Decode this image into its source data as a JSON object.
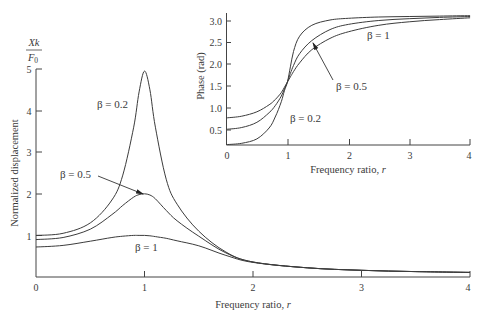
{
  "chart_data": [
    {
      "id": "amplitude",
      "type": "line",
      "title": "",
      "xlabel": "Frequency ratio, r",
      "ylabel": "Normalized displacement",
      "ylabel_top": {
        "numerator": "Xk",
        "denominator": "F0"
      },
      "xlim": [
        0,
        4
      ],
      "ylim": [
        0,
        5
      ],
      "xticks": [
        "0",
        "1",
        "2",
        "3",
        "4"
      ],
      "yticks": [
        "1",
        "2",
        "3",
        "4",
        "5"
      ],
      "grid": false,
      "x": [
        0,
        0.25,
        0.5,
        0.7,
        0.8,
        0.9,
        0.95,
        1.0,
        1.05,
        1.1,
        1.2,
        1.3,
        1.5,
        1.75,
        2.0,
        2.5,
        3.0,
        3.5,
        4.0
      ],
      "series": [
        {
          "name": "β = 0.2",
          "values": [
            1.0,
            1.05,
            1.3,
            1.85,
            2.45,
            3.6,
            4.45,
            4.95,
            4.5,
            3.6,
            2.35,
            1.75,
            1.1,
            0.6,
            0.36,
            0.22,
            0.16,
            0.13,
            0.11
          ]
        },
        {
          "name": "β = 0.5",
          "values": [
            0.9,
            0.95,
            1.15,
            1.5,
            1.72,
            1.92,
            1.98,
            2.0,
            1.97,
            1.88,
            1.6,
            1.35,
            0.98,
            0.58,
            0.36,
            0.22,
            0.16,
            0.13,
            0.11
          ]
        },
        {
          "name": "β = 1",
          "values": [
            0.72,
            0.76,
            0.86,
            0.95,
            0.98,
            1.0,
            1.0,
            1.0,
            0.99,
            0.97,
            0.93,
            0.87,
            0.75,
            0.52,
            0.35,
            0.22,
            0.16,
            0.13,
            0.11
          ]
        }
      ],
      "annotations": [
        {
          "text": "β = 0.2",
          "x": 0.6,
          "y": 4.1
        },
        {
          "text": "β = 0.5",
          "x": 0.25,
          "y": 2.5,
          "arrow_to": [
            1.0,
            2.0
          ]
        },
        {
          "text": "β = 1",
          "x": 1.05,
          "y": 0.7
        }
      ]
    },
    {
      "id": "phase_inset",
      "type": "line",
      "title": "",
      "xlabel": "Frequency ratio, r",
      "ylabel": "Phase (rad)",
      "xlim": [
        0,
        4
      ],
      "ylim": [
        0,
        3.14
      ],
      "xticks": [
        "0",
        "1",
        "2",
        "3",
        "4"
      ],
      "yticks": [
        "0.5",
        "1.0",
        "1.5",
        "2.0",
        "2.5",
        "3.0"
      ],
      "grid": false,
      "x": [
        0,
        0.25,
        0.5,
        0.7,
        0.8,
        0.9,
        0.95,
        1.0,
        1.05,
        1.1,
        1.2,
        1.4,
        1.7,
        2.0,
        2.5,
        3.0,
        3.5,
        4.0
      ],
      "series": [
        {
          "name": "β = 0.2",
          "values": [
            0.17,
            0.2,
            0.3,
            0.55,
            0.8,
            1.15,
            1.4,
            1.6,
            1.95,
            2.3,
            2.65,
            2.9,
            3.02,
            3.06,
            3.09,
            3.1,
            3.11,
            3.12
          ]
        },
        {
          "name": "β = 0.5",
          "values": [
            0.52,
            0.56,
            0.68,
            0.9,
            1.06,
            1.28,
            1.44,
            1.6,
            1.8,
            1.98,
            2.25,
            2.55,
            2.8,
            2.92,
            3.01,
            3.05,
            3.08,
            3.1
          ]
        },
        {
          "name": "β = 1",
          "values": [
            0.78,
            0.82,
            0.92,
            1.08,
            1.2,
            1.36,
            1.48,
            1.6,
            1.72,
            1.84,
            2.04,
            2.34,
            2.6,
            2.75,
            2.9,
            2.98,
            3.03,
            3.07
          ]
        }
      ],
      "annotations": [
        {
          "text": "β = 1",
          "x": 2.3,
          "y": 2.7
        },
        {
          "text": "β = 0.5",
          "x": 1.8,
          "y": 1.5,
          "arrow_to": [
            1.4,
            2.5
          ]
        },
        {
          "text": "β = 0.2",
          "x": 1.1,
          "y": 0.85
        }
      ]
    }
  ],
  "main": {
    "y_numerator": "Xk",
    "y_denominator_base": "F",
    "y_denominator_sub": "0",
    "ylabel": "Normalized displacement",
    "xlabel_prefix": "Frequency ratio, ",
    "xlabel_var": "r",
    "xticks": [
      "0",
      "1",
      "2",
      "3",
      "4"
    ],
    "yticks": [
      "0",
      "1",
      "2",
      "3",
      "4",
      "5"
    ],
    "labels": {
      "b02": "β = 0.2",
      "b05": "β = 0.5",
      "b1": "β = 1"
    }
  },
  "inset": {
    "ylabel": "Phase (rad)",
    "xlabel_prefix": "Frequency ratio, ",
    "xlabel_var": "r",
    "xticks": [
      "0",
      "1",
      "2",
      "3",
      "4"
    ],
    "yticks": [
      "0.5",
      "1.0",
      "1.5",
      "2.0",
      "2.5",
      "3.0"
    ],
    "labels": {
      "b1": "β = 1",
      "b05": "β = 0.5",
      "b02": "β = 0.2"
    }
  }
}
